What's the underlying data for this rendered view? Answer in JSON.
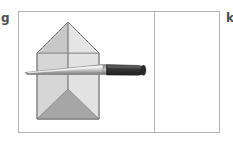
{
  "figure": {
    "width": 233,
    "height": 144,
    "background_color": "#ffffff",
    "labels": {
      "left": "g",
      "right": "k"
    },
    "frame": {
      "border_color": "#b2b2b2",
      "fill_color": "#ffffff",
      "divider_color": "#b2b2b2",
      "left": 18,
      "top": 11,
      "width": 202,
      "height": 122,
      "divider_x": 135
    },
    "cells": [
      {
        "name": "left-cell",
        "content": "paper-house-with-knife"
      },
      {
        "name": "right-cell",
        "content": "empty"
      }
    ],
    "colors": {
      "outline": "#808080",
      "face_light": "#e0e0e0",
      "face_mid": "#cfcfcf",
      "face_dark": "#a8a8a8",
      "face_darker": "#9a9a9a",
      "blade_light": "#f0f0f0",
      "blade_mid": "#bdbdbd",
      "blade_dark": "#8f8f8f",
      "handle_dark": "#3a3a3a",
      "handle_darker": "#2b2b2b"
    },
    "objects": {
      "paper_model": {
        "name": "folded-paper-house",
        "description": "Pentagonal house-shaped folded paper form with crease lines forming a roof apex, a central vertical fold, and a lower V-shaped fold.",
        "apex": [
          67,
          21
        ],
        "roof_left": [
          36,
          52
        ],
        "roof_right": [
          98,
          52
        ],
        "body_bottom_left": [
          36,
          118
        ],
        "body_bottom_right": [
          98,
          118
        ],
        "v_fold_point": [
          67,
          88
        ]
      },
      "knife": {
        "name": "kitchen-knife",
        "description": "A knife lying horizontally across the paper model, sharp tip pointing left, dark handle to the right.",
        "tip": [
          24,
          70
        ],
        "blade_end": [
          104,
          66
        ],
        "handle_start": [
          104,
          63
        ],
        "handle_end": [
          144,
          67
        ],
        "blade_color": "#c2c2c2",
        "handle_color": "#3a3a3a"
      }
    }
  }
}
